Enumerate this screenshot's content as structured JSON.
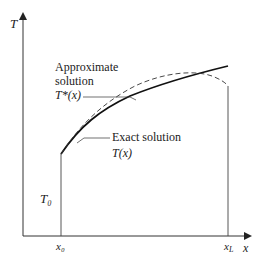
{
  "diagram": {
    "axes": {
      "y_label": "T",
      "x_label": "x"
    },
    "ticks": {
      "x0": "x₀",
      "xL": "x",
      "xL_sub": "L"
    },
    "boundary_label": "T₀",
    "approx": {
      "line1": "Approximate",
      "line2": "solution",
      "line3": "T*(x)"
    },
    "exact": {
      "line1": "Exact solution",
      "line2": "T(x)"
    },
    "colors": {
      "ink": "#222222",
      "axis": "#333333"
    }
  }
}
